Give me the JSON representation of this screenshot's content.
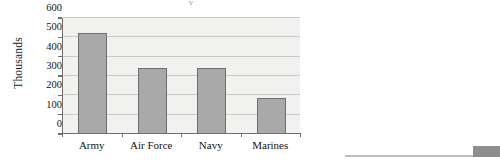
{
  "figure": {
    "title_remnant": "y",
    "y_axis_title": "Thousands"
  },
  "chart_data": {
    "type": "bar",
    "title": "",
    "xlabel": "",
    "ylabel": "Thousands",
    "categories": [
      "Army",
      "Air Force",
      "Navy",
      "Marines"
    ],
    "values": [
      520,
      340,
      340,
      185
    ],
    "ylim": [
      0,
      600
    ],
    "yticks": [
      0,
      100,
      200,
      300,
      400,
      500,
      600
    ],
    "ytick_labels": [
      "0",
      "100",
      "200",
      "300",
      "400",
      "500",
      "600"
    ],
    "grid": true,
    "legend": false,
    "series": [
      {
        "name": "Personnel",
        "values": [
          520,
          340,
          340,
          185
        ]
      }
    ],
    "colors": {
      "bar_fill": "#a9a9a9",
      "bar_edge": "#6d6d6d",
      "plot_background": "#f1f1ef",
      "gridline": "#c9c9c5",
      "axis": "#6f6f6f"
    }
  },
  "artifacts": {
    "rule_color": "#bdbdbd",
    "swatch_color": "#8e8e8e"
  }
}
